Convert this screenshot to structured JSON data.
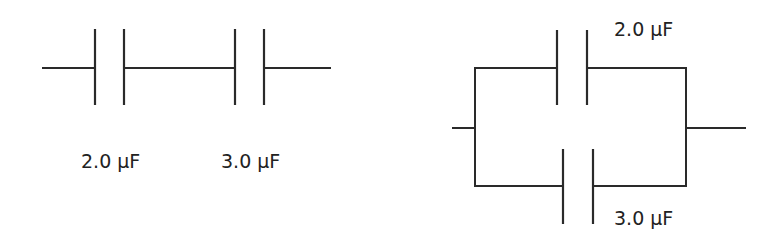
{
  "diagram": {
    "series_circuit": {
      "title": "Series capacitors",
      "capacitors": [
        {
          "label": "2.0 μF",
          "value": 2.0,
          "unit": "μF"
        },
        {
          "label": "3.0 μF",
          "value": 3.0,
          "unit": "μF"
        }
      ]
    },
    "parallel_circuit": {
      "title": "Parallel capacitors",
      "capacitors": [
        {
          "label": "2.0 μF",
          "value": 2.0,
          "unit": "μF",
          "branch": "top"
        },
        {
          "label": "3.0 μF",
          "value": 3.0,
          "unit": "μF",
          "branch": "bottom"
        }
      ]
    },
    "colors": {
      "line": "#2a2a2a",
      "text": "#222222",
      "background": "#ffffff"
    }
  }
}
